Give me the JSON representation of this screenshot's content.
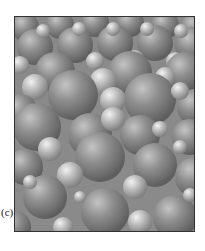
{
  "figure": {
    "panel_label": "(c)",
    "colors": {
      "large_sphere": "#8c8c8c",
      "small_sphere": "#b8b8b8",
      "background": "#9a9a9a",
      "border": "#333333"
    }
  }
}
